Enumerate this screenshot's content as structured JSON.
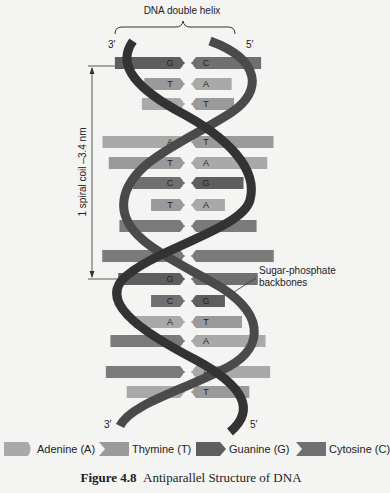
{
  "title": "DNA double helix",
  "strand_ends": {
    "top_left": "3′",
    "top_right": "5′",
    "bottom_left": "3′",
    "bottom_right": "5′"
  },
  "measure_label": "1 spiral coil –3.4 nm",
  "backbone_label_line1": "Sugar-phosphate",
  "backbone_label_line2": "backbones",
  "colors": {
    "adenine": "#a9a9a9",
    "thymine": "#9a9a9a",
    "guanine": "#5e5e5e",
    "cytosine": "#707070",
    "backbone": "#3a3a3a",
    "background": "#f4f4f2"
  },
  "base_pairs": [
    {
      "y": 63,
      "left": "G",
      "right": "C"
    },
    {
      "y": 84,
      "left": "T",
      "right": "A"
    },
    {
      "y": 104,
      "left": "A",
      "right": "T"
    },
    {
      "y": 142,
      "left": "A",
      "right": "T"
    },
    {
      "y": 163,
      "left": "T",
      "right": "A"
    },
    {
      "y": 183,
      "left": "C",
      "right": "G"
    },
    {
      "y": 205,
      "left": "T",
      "right": "A"
    },
    {
      "y": 226,
      "left": "",
      "right": ""
    },
    {
      "y": 256,
      "left": "",
      "right": ""
    },
    {
      "y": 279,
      "left": "G",
      "right": "C"
    },
    {
      "y": 301,
      "left": "C",
      "right": "G"
    },
    {
      "y": 322,
      "left": "A",
      "right": "T"
    },
    {
      "y": 341,
      "left": "",
      "right": "A"
    },
    {
      "y": 372,
      "left": "",
      "right": "A"
    },
    {
      "y": 392,
      "left": "A",
      "right": "T"
    }
  ],
  "legend": [
    {
      "key": "adenine",
      "label": "Adenine (A)"
    },
    {
      "key": "thymine",
      "label": "Thymine (T)"
    },
    {
      "key": "guanine",
      "label": "Guanine (G)"
    },
    {
      "key": "cytosine",
      "label": "Cytosine (C)"
    }
  ],
  "caption": {
    "number": "Figure 4.8",
    "text": "Antiparallel Structure of DNA"
  }
}
